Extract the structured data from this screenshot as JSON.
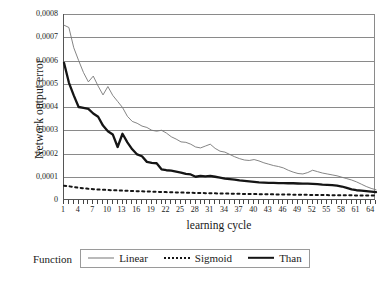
{
  "chart_data": {
    "type": "line",
    "title": "",
    "xlabel": "learning cycle",
    "ylabel": "Network output error",
    "xlim": [
      1,
      65
    ],
    "ylim": [
      0,
      0.0008
    ],
    "grid": true,
    "legend_position": "bottom",
    "legend_title": "Function",
    "y_tick_labels": [
      "0,0008",
      "0,0007",
      "0,0006",
      "0,0005",
      "0,0004",
      "0,0003",
      "0,0002",
      "0,0001",
      "0"
    ],
    "y_tick_values": [
      0.0008,
      0.0007,
      0.0006,
      0.0005,
      0.0004,
      0.0003,
      0.0002,
      0.0001,
      0
    ],
    "x_tick_labels": [
      "1",
      "4",
      "7",
      "10",
      "13",
      "16",
      "19",
      "22",
      "25",
      "28",
      "31",
      "34",
      "37",
      "40",
      "43",
      "46",
      "49",
      "52",
      "55",
      "58",
      "61",
      "64"
    ],
    "x_tick_values": [
      1,
      4,
      7,
      10,
      13,
      16,
      19,
      22,
      25,
      28,
      31,
      34,
      37,
      40,
      43,
      46,
      49,
      52,
      55,
      58,
      61,
      64
    ],
    "x": [
      1,
      2,
      3,
      4,
      5,
      6,
      7,
      8,
      9,
      10,
      11,
      12,
      13,
      14,
      15,
      16,
      17,
      18,
      19,
      20,
      21,
      22,
      23,
      24,
      25,
      26,
      27,
      28,
      29,
      30,
      31,
      32,
      33,
      34,
      35,
      36,
      37,
      38,
      39,
      40,
      41,
      42,
      43,
      44,
      45,
      46,
      47,
      48,
      49,
      50,
      51,
      52,
      53,
      54,
      55,
      56,
      57,
      58,
      59,
      60,
      61,
      62,
      63,
      64,
      65
    ],
    "series": [
      {
        "name": "Linear",
        "color": "#777777",
        "style": "solid-thin",
        "values": [
          0.000752,
          0.000742,
          0.000655,
          0.0006,
          0.000548,
          0.000508,
          0.000533,
          0.00049,
          0.000452,
          0.000488,
          0.00045,
          0.000424,
          0.000398,
          0.00036,
          0.000338,
          0.00033,
          0.000318,
          0.000312,
          0.0003,
          0.000296,
          0.0003,
          0.000288,
          0.000272,
          0.000262,
          0.00025,
          0.000248,
          0.00024,
          0.000228,
          0.000224,
          0.000232,
          0.00024,
          0.000222,
          0.00021,
          0.000206,
          0.000196,
          0.000186,
          0.000178,
          0.000172,
          0.00017,
          0.000174,
          0.000168,
          0.00016,
          0.000154,
          0.000148,
          0.000144,
          0.000138,
          0.000128,
          0.00012,
          0.000114,
          0.000112,
          0.000118,
          0.000128,
          0.000122,
          0.000116,
          0.000112,
          0.000108,
          0.000104,
          9.8e-05,
          9.2e-05,
          8.6e-05,
          7.8e-05,
          6.8e-05,
          5.8e-05,
          5e-05,
          4.4e-05
        ]
      },
      {
        "name": "Sigmoid",
        "color": "#151515",
        "style": "dotted",
        "values": [
          6.1e-05,
          5.9e-05,
          5.6e-05,
          5.3e-05,
          5.05e-05,
          4.8e-05,
          4.65e-05,
          4.5e-05,
          4.4e-05,
          4.3e-05,
          4.2e-05,
          4.12e-05,
          4.04e-05,
          3.96e-05,
          3.88e-05,
          3.8e-05,
          3.73e-05,
          3.66e-05,
          3.59e-05,
          3.52e-05,
          3.45e-05,
          3.39e-05,
          3.33e-05,
          3.27e-05,
          3.21e-05,
          3.15e-05,
          3.1e-05,
          3.05e-05,
          3e-05,
          2.95e-05,
          2.9e-05,
          2.85e-05,
          2.81e-05,
          2.77e-05,
          2.73e-05,
          2.69e-05,
          2.65e-05,
          2.61e-05,
          2.57e-05,
          2.54e-05,
          2.51e-05,
          2.48e-05,
          2.45e-05,
          2.42e-05,
          2.39e-05,
          2.36e-05,
          2.33e-05,
          2.3e-05,
          2.27e-05,
          2.24e-05,
          2.21e-05,
          2.18e-05,
          2.15e-05,
          2.12e-05,
          2.1e-05,
          2.08e-05,
          2.06e-05,
          2.04e-05,
          2.02e-05,
          2e-05,
          1.98e-05,
          1.96e-05,
          1.94e-05,
          1.92e-05,
          1.9e-05
        ]
      },
      {
        "name": "Than",
        "color": "#151515",
        "style": "solid-thick",
        "values": [
          0.00059,
          0.000505,
          0.00045,
          0.0004,
          0.000396,
          0.000392,
          0.000372,
          0.000358,
          0.00032,
          0.000296,
          0.000282,
          0.000228,
          0.000285,
          0.000248,
          0.000218,
          0.000196,
          0.000188,
          0.000164,
          0.00016,
          0.000158,
          0.000132,
          0.000128,
          0.000126,
          0.000122,
          0.000118,
          0.000112,
          0.00011,
          0.0001,
          0.000104,
          0.000102,
          0.000104,
          0.0001,
          9.6e-05,
          9.2e-05,
          9e-05,
          8.8e-05,
          8.4e-05,
          8.2e-05,
          8e-05,
          7.8e-05,
          7.6e-05,
          7.5e-05,
          7.4e-05,
          7.4e-05,
          7.3e-05,
          7.3e-05,
          7.2e-05,
          7.2e-05,
          7.1e-05,
          7e-05,
          7e-05,
          6.9e-05,
          6.8e-05,
          6.6e-05,
          6.5e-05,
          6.4e-05,
          6.2e-05,
          5.8e-05,
          5.2e-05,
          4.6e-05,
          4.2e-05,
          4e-05,
          3.8e-05,
          3.6e-05,
          3.4e-05
        ]
      }
    ]
  },
  "legend": {
    "title": "Function",
    "entries": [
      {
        "label": "Linear"
      },
      {
        "label": "Sigmoid"
      },
      {
        "label": "Than"
      }
    ]
  }
}
